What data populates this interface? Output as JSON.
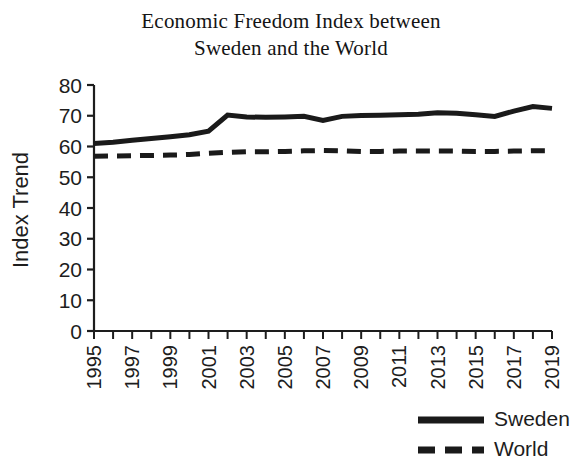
{
  "chart_data": {
    "type": "line",
    "title": "Economic Freedom Index between Sweden and the World",
    "title_lines": [
      "Economic Freedom Index between",
      "Sweden and the World"
    ],
    "xlabel": "",
    "ylabel": "Index Trend",
    "ylim": [
      0,
      80
    ],
    "y_ticks": [
      0,
      10,
      20,
      30,
      40,
      50,
      60,
      70,
      80
    ],
    "y_tick_labels": [
      "0",
      "10",
      "20",
      "30",
      "40",
      "50",
      "60",
      "70",
      "80"
    ],
    "xlim": [
      1995,
      2019
    ],
    "x": [
      1995,
      1996,
      1997,
      1998,
      1999,
      2000,
      2001,
      2002,
      2003,
      2004,
      2005,
      2006,
      2007,
      2008,
      2009,
      2010,
      2011,
      2012,
      2013,
      2014,
      2015,
      2016,
      2017,
      2018,
      2019
    ],
    "x_tick_labels": [
      "1995",
      "1997",
      "1999",
      "2001",
      "2003",
      "2005",
      "2007",
      "2009",
      "2011",
      "2013",
      "2015",
      "2017",
      "2019"
    ],
    "x_tick_label_values": [
      1995,
      1997,
      1999,
      2001,
      2003,
      2005,
      2007,
      2009,
      2011,
      2013,
      2015,
      2017,
      2019
    ],
    "x_tick_label_rotation": -90,
    "grid": false,
    "legend_position": "bottom-right",
    "series": [
      {
        "name": "Sweden",
        "style": "solid",
        "color": "#1a1a1a",
        "line_width": 5,
        "values": [
          61.0,
          61.4,
          62.0,
          62.6,
          63.2,
          63.8,
          65.0,
          70.2,
          69.6,
          69.5,
          69.6,
          69.8,
          68.5,
          69.8,
          70.1,
          70.2,
          70.3,
          70.5,
          71.0,
          70.8,
          70.3,
          69.8,
          71.5,
          73.0,
          72.4
        ]
      },
      {
        "name": "World",
        "style": "dashed",
        "color": "#1a1a1a",
        "line_width": 5,
        "values": [
          56.8,
          56.9,
          57.0,
          57.1,
          57.2,
          57.4,
          57.8,
          58.1,
          58.3,
          58.3,
          58.4,
          58.6,
          58.7,
          58.6,
          58.4,
          58.4,
          58.5,
          58.5,
          58.5,
          58.5,
          58.4,
          58.4,
          58.5,
          58.6,
          58.6
        ]
      }
    ],
    "legend": [
      {
        "label": "Sweden",
        "style": "solid"
      },
      {
        "label": "World",
        "style": "dashed"
      }
    ]
  }
}
